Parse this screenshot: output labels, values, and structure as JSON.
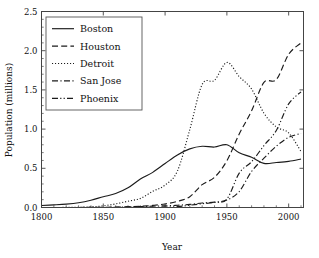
{
  "chart_data": {
    "type": "line",
    "title": "",
    "xlabel": "Year",
    "ylabel": "Population (millions)",
    "xlim": [
      1800,
      2012
    ],
    "ylim": [
      0.0,
      2.5
    ],
    "xticks": [
      1800,
      1850,
      1900,
      1950,
      2000
    ],
    "yticks": [
      0.0,
      0.5,
      1.0,
      1.5,
      2.0,
      2.5
    ],
    "xtick_labels": [
      "1800",
      "1850",
      "1900",
      "1950",
      "2000"
    ],
    "ytick_labels": [
      "0.0",
      "0.5",
      "1.0",
      "1.5",
      "2.0",
      "2.5"
    ],
    "grid": false,
    "legend_position": "upper left",
    "x": [
      1800,
      1810,
      1820,
      1830,
      1840,
      1850,
      1860,
      1870,
      1880,
      1890,
      1900,
      1910,
      1920,
      1930,
      1940,
      1950,
      1960,
      1970,
      1980,
      1990,
      2000,
      2010
    ],
    "series": [
      {
        "name": "Boston",
        "linestyle": "solid",
        "values": [
          0.025,
          0.033,
          0.043,
          0.061,
          0.093,
          0.137,
          0.178,
          0.251,
          0.363,
          0.448,
          0.561,
          0.671,
          0.748,
          0.781,
          0.771,
          0.801,
          0.697,
          0.641,
          0.563,
          0.574,
          0.589,
          0.618
        ]
      },
      {
        "name": "Houston",
        "linestyle": "dashed",
        "values": [
          0.0,
          0.0,
          0.0,
          0.0,
          0.002,
          0.002,
          0.005,
          0.009,
          0.016,
          0.027,
          0.045,
          0.079,
          0.138,
          0.292,
          0.385,
          0.596,
          0.938,
          1.233,
          1.595,
          1.631,
          1.954,
          2.1
        ]
      },
      {
        "name": "Detroit",
        "linestyle": "dotted",
        "values": [
          0.0,
          0.0,
          0.001,
          0.002,
          0.009,
          0.021,
          0.046,
          0.08,
          0.116,
          0.206,
          0.286,
          0.466,
          0.994,
          1.569,
          1.623,
          1.85,
          1.67,
          1.511,
          1.203,
          1.028,
          0.951,
          0.714
        ]
      },
      {
        "name": "San Jose",
        "linestyle": "dashdot",
        "values": [
          0.0,
          0.0,
          0.0,
          0.0,
          0.0,
          0.0,
          0.002,
          0.009,
          0.012,
          0.018,
          0.021,
          0.029,
          0.039,
          0.058,
          0.068,
          0.095,
          0.204,
          0.46,
          0.629,
          0.782,
          0.895,
          0.945
        ]
      },
      {
        "name": "Phoenix",
        "linestyle": "dashdotdot",
        "values": [
          0.0,
          0.0,
          0.0,
          0.0,
          0.0,
          0.0,
          0.0,
          0.0,
          0.002,
          0.003,
          0.005,
          0.011,
          0.029,
          0.048,
          0.065,
          0.107,
          0.439,
          0.584,
          0.79,
          0.983,
          1.321,
          1.475
        ]
      }
    ]
  },
  "legend": {
    "entries": [
      {
        "label": "Boston"
      },
      {
        "label": "Houston"
      },
      {
        "label": "Detroit"
      },
      {
        "label": "San Jose"
      },
      {
        "label": "Phoenix"
      }
    ]
  },
  "axes": {
    "x_title": "Year",
    "y_title": "Population (millions)"
  }
}
